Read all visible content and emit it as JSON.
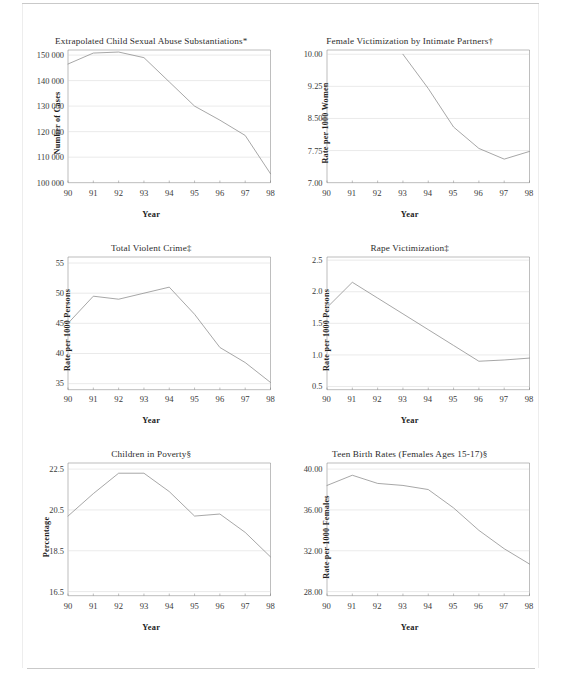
{
  "page": {
    "background": "#ffffff",
    "line_color": "#8a8a8a",
    "grid_color": "#cfcfcf",
    "axis_color": "#6e6e6e",
    "text_color": "#2d2d2d"
  },
  "xlabel": "Year",
  "charts": [
    {
      "id": "extrapolated-child-sexual-abuse-substantiations",
      "chart_data": {
        "type": "line",
        "title": "Extrapolated Child Sexual Abuse Substantiations*",
        "xlabel": "Year",
        "ylabel": "Number of Cases",
        "categories": [
          "90",
          "91",
          "92",
          "93",
          "94",
          "95",
          "96",
          "97",
          "98"
        ],
        "x": [
          90,
          91,
          92,
          93,
          94,
          95,
          96,
          97,
          98
        ],
        "values": [
          146500,
          150800,
          151200,
          149000,
          139500,
          130000,
          124500,
          118500,
          103500
        ],
        "ylim": [
          100000,
          152000
        ],
        "yticks": [
          100000,
          110000,
          120000,
          130000,
          140000,
          150000
        ],
        "ytick_labels": [
          "100 000",
          "110 000",
          "120 000",
          "130 000",
          "140 000",
          "150 000"
        ],
        "xlim": [
          90,
          98
        ],
        "grid": true,
        "legend": "none"
      }
    },
    {
      "id": "female-victimization-by-intimate-partners",
      "chart_data": {
        "type": "line",
        "title": "Female Victimization by Intimate Partners†",
        "xlabel": "Year",
        "ylabel": "Rate per 1000 Women",
        "categories": [
          "90",
          "91",
          "92",
          "93",
          "94",
          "95",
          "96",
          "97",
          "98"
        ],
        "x": [
          93,
          94,
          95,
          96,
          97,
          98
        ],
        "values": [
          10.0,
          9.2,
          8.3,
          7.8,
          7.55,
          7.73
        ],
        "ylim": [
          7.0,
          10.1
        ],
        "yticks": [
          7.0,
          7.75,
          8.5,
          9.25,
          10.0
        ],
        "ytick_labels": [
          "7.00",
          "7.75",
          "8.50",
          "9.25",
          "10.00"
        ],
        "xlim": [
          90,
          98
        ],
        "grid": true,
        "legend": "none"
      }
    },
    {
      "id": "total-violent-crime",
      "chart_data": {
        "type": "line",
        "title": "Total Violent Crime‡",
        "xlabel": "Year",
        "ylabel": "Rate per 1000 Persons",
        "categories": [
          "90",
          "91",
          "92",
          "93",
          "94",
          "95",
          "96",
          "97",
          "98"
        ],
        "x": [
          90,
          91,
          92,
          93,
          94,
          95,
          96,
          97,
          98
        ],
        "values": [
          45.0,
          49.5,
          49.0,
          50.0,
          51.0,
          46.5,
          41.0,
          38.5,
          35.2
        ],
        "ylim": [
          34.0,
          56.0
        ],
        "yticks": [
          35,
          40,
          45,
          50,
          55
        ],
        "ytick_labels": [
          "35",
          "40",
          "45",
          "50",
          "55"
        ],
        "xlim": [
          90,
          98
        ],
        "grid": true,
        "legend": "none"
      }
    },
    {
      "id": "rape-victimization",
      "chart_data": {
        "type": "line",
        "title": "Rape Victimization‡",
        "xlabel": "Year",
        "ylabel": "Rate per 1000 Persons",
        "categories": [
          "90",
          "91",
          "92",
          "93",
          "94",
          "95",
          "96",
          "97",
          "98"
        ],
        "x": [
          90,
          91,
          92,
          93,
          94,
          95,
          96,
          97,
          98
        ],
        "values": [
          1.75,
          2.15,
          1.9,
          1.65,
          1.4,
          1.15,
          0.9,
          0.92,
          0.95
        ],
        "ylim": [
          0.45,
          2.55
        ],
        "yticks": [
          0.5,
          1.0,
          1.5,
          2.0,
          2.5
        ],
        "ytick_labels": [
          "0.5",
          "1.0",
          "1.5",
          "2.0",
          "2.5"
        ],
        "xlim": [
          90,
          98
        ],
        "grid": true,
        "legend": "none"
      }
    },
    {
      "id": "children-in-poverty",
      "chart_data": {
        "type": "line",
        "title": "Children in Poverty§",
        "xlabel": "Year",
        "ylabel": "Percentage",
        "categories": [
          "90",
          "91",
          "92",
          "93",
          "94",
          "95",
          "96",
          "97",
          "98"
        ],
        "x": [
          90,
          91,
          92,
          93,
          94,
          95,
          96,
          97,
          98
        ],
        "values": [
          20.2,
          21.3,
          22.3,
          22.3,
          21.4,
          20.2,
          20.3,
          19.4,
          18.2
        ],
        "ylim": [
          16.3,
          22.8
        ],
        "yticks": [
          16.5,
          18.5,
          20.5,
          22.5
        ],
        "ytick_labels": [
          "16.5",
          "18.5",
          "20.5",
          "22.5"
        ],
        "xlim": [
          90,
          98
        ],
        "grid": true,
        "legend": "none"
      }
    },
    {
      "id": "teen-birth-rates",
      "chart_data": {
        "type": "line",
        "title": "Teen Birth Rates (Females Ages 15-17)§",
        "xlabel": "Year",
        "ylabel": "Rate per 1000 Females",
        "categories": [
          "90",
          "91",
          "92",
          "93",
          "94",
          "95",
          "96",
          "97",
          "98"
        ],
        "x": [
          90,
          91,
          92,
          93,
          94,
          95,
          96,
          97,
          98
        ],
        "values": [
          38.4,
          39.4,
          38.6,
          38.4,
          38.0,
          36.2,
          34.0,
          32.2,
          30.7
        ],
        "ylim": [
          27.6,
          40.6
        ],
        "yticks": [
          28.0,
          32.0,
          36.0,
          40.0
        ],
        "ytick_labels": [
          "28.00",
          "32.00",
          "36.00",
          "40.00"
        ],
        "xlim": [
          90,
          98
        ],
        "grid": true,
        "legend": "none"
      }
    }
  ]
}
